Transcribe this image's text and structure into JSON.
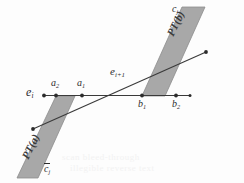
{
  "figure": {
    "width": 244,
    "height": 183,
    "background_color": "#fdfdfd",
    "band_fill_color": "#a8a8a8",
    "band_stroke_color": "#8d8d8d",
    "line_color": "#3a3a3a",
    "text_color": "#2c2c2c"
  },
  "labels": {
    "edge_i": "e",
    "edge_i_sub": "i",
    "a2": "a",
    "a2_sub": "2",
    "a1": "a",
    "a1_sub": "1",
    "b1": "b",
    "b1_sub": "1",
    "b2": "b",
    "b2_sub": "2",
    "edge_next": "e",
    "edge_next_sub": "i+1",
    "cj_top": "c",
    "cj_top_sub": "j",
    "cj_bottom": "c",
    "cj_bottom_sub": "j",
    "pt_b": "PT(b)",
    "pt_a": "PT(a)"
  },
  "geometry": {
    "horizontal_line": {
      "x1": 43,
      "y1": 95,
      "x2": 191,
      "y2": 95
    },
    "diagonal_line": {
      "x1": 33,
      "y1": 129,
      "x2": 206,
      "y2": 52
    },
    "points": [
      {
        "name": "e_i",
        "x": 44,
        "y": 95
      },
      {
        "name": "a_2",
        "x": 56,
        "y": 95
      },
      {
        "name": "a_1",
        "x": 82,
        "y": 95
      },
      {
        "name": "b_1",
        "x": 142,
        "y": 95
      },
      {
        "name": "b_2",
        "x": 176,
        "y": 95
      }
    ],
    "band_upper_pt_b": "parallelogram from (142,96) rising right to (186,7)",
    "band_lower_pt_a": "parallelogram from (56,96) descending left to (17,178)"
  },
  "ghost_text": {
    "line1": "scan bleed-through",
    "line2": "illegible reverse text"
  }
}
